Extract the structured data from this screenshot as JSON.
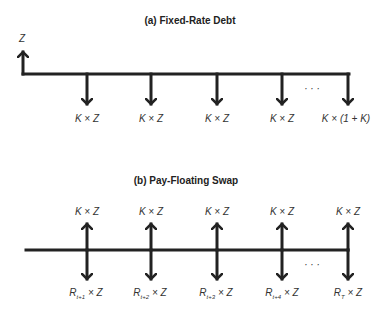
{
  "panel_a": {
    "title": "(a) Fixed-Rate Debt",
    "inflow_label": "Z",
    "outflow_labels": [
      "K × Z",
      "K × Z",
      "K × Z",
      "K × Z",
      "K × (1 + K)"
    ],
    "ellipsis": "· · ·"
  },
  "panel_b": {
    "title": "(b) Pay-Floating Swap",
    "receive_labels": [
      "K × Z",
      "K × Z",
      "K × Z",
      "K × Z",
      "K × Z"
    ],
    "pay_labels": [
      {
        "base": "R",
        "sub": "t+1",
        "rest": " × Z"
      },
      {
        "base": "R",
        "sub": "t+2",
        "rest": " × Z"
      },
      {
        "base": "R",
        "sub": "t+3",
        "rest": " × Z"
      },
      {
        "base": "R",
        "sub": "t+4",
        "rest": " × Z"
      },
      {
        "base": "R",
        "sub": "T",
        "rest": " × Z"
      }
    ],
    "ellipsis": "· · ·"
  }
}
